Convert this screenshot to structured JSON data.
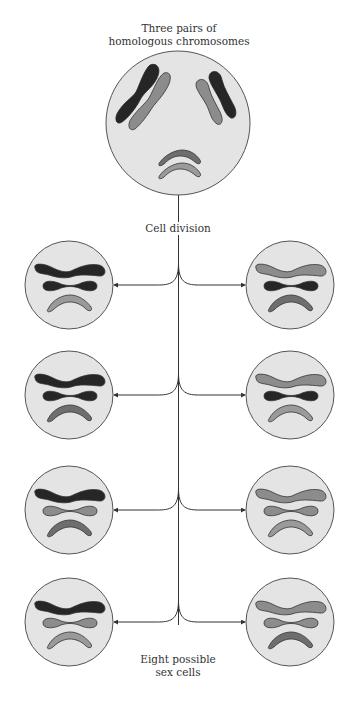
{
  "title": {
    "line1": "Three pairs of",
    "line2": "homologous chromosomes"
  },
  "division_label": "Cell division",
  "result_label": {
    "line1": "Eight possible",
    "line2": "sex cells"
  },
  "colors": {
    "cell_fill": "#e4e4e4",
    "cell_stroke": "#555555",
    "dark": "#262626",
    "light": "#8c8c8c",
    "bent_dark": "#6e6e6e",
    "bent_light": "#9a9a9a",
    "line": "#333333"
  },
  "parent_cell": {
    "chromosome_pairs": [
      {
        "name": "long",
        "members": [
          "dark",
          "light"
        ]
      },
      {
        "name": "medium",
        "members": [
          "dark",
          "light"
        ]
      },
      {
        "name": "bent",
        "members": [
          "bent_dark",
          "bent_light"
        ]
      }
    ]
  },
  "daughter_cells": [
    {
      "row": 1,
      "side": "left",
      "long": "dark",
      "medium": "dark",
      "bent": "bent_light"
    },
    {
      "row": 1,
      "side": "right",
      "long": "light",
      "medium": "dark",
      "bent": "bent_dark"
    },
    {
      "row": 2,
      "side": "left",
      "long": "dark",
      "medium": "dark",
      "bent": "bent_dark"
    },
    {
      "row": 2,
      "side": "right",
      "long": "light",
      "medium": "dark",
      "bent": "bent_light"
    },
    {
      "row": 3,
      "side": "left",
      "long": "dark",
      "medium": "light",
      "bent": "bent_dark"
    },
    {
      "row": 3,
      "side": "right",
      "long": "light",
      "medium": "light",
      "bent": "bent_light"
    },
    {
      "row": 4,
      "side": "left",
      "long": "dark",
      "medium": "light",
      "bent": "bent_light"
    },
    {
      "row": 4,
      "side": "right",
      "long": "light",
      "medium": "light",
      "bent": "bent_dark"
    }
  ]
}
